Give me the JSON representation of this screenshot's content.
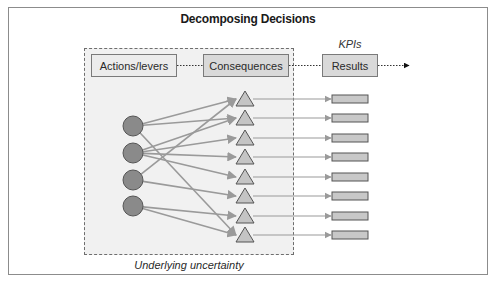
{
  "title": "Decomposing Decisions",
  "stages": {
    "actions": "Actions/levers",
    "consequences": "Consequences",
    "results": "Results"
  },
  "kpis_label": "KPIs",
  "uncertainty_label": "Underlying uncertainty",
  "colors": {
    "frame_border": "#8c8c8c",
    "uncertainty_fill": "#f1f1f1",
    "node_circle_fill": "#8a8a8a",
    "node_triangle_fill": "#c4c4c4",
    "result_bar_fill": "#c8c8c8",
    "edge_color": "#9a9a9a"
  },
  "nodes": {
    "actions": [
      {
        "id": "A1",
        "shape": "circle",
        "y": 126
      },
      {
        "id": "A2",
        "shape": "circle",
        "y": 153
      },
      {
        "id": "A3",
        "shape": "circle",
        "y": 180
      },
      {
        "id": "A4",
        "shape": "circle",
        "y": 206
      }
    ],
    "consequences": [
      {
        "id": "C1",
        "shape": "triangle",
        "y": 99
      },
      {
        "id": "C2",
        "shape": "triangle",
        "y": 118
      },
      {
        "id": "C3",
        "shape": "triangle",
        "y": 138
      },
      {
        "id": "C4",
        "shape": "triangle",
        "y": 157
      },
      {
        "id": "C5",
        "shape": "triangle",
        "y": 177
      },
      {
        "id": "C6",
        "shape": "triangle",
        "y": 196
      },
      {
        "id": "C7",
        "shape": "triangle",
        "y": 216
      },
      {
        "id": "C8",
        "shape": "triangle",
        "y": 235
      }
    ],
    "results": [
      {
        "id": "R1",
        "shape": "bar",
        "y": 99
      },
      {
        "id": "R2",
        "shape": "bar",
        "y": 118
      },
      {
        "id": "R3",
        "shape": "bar",
        "y": 138
      },
      {
        "id": "R4",
        "shape": "bar",
        "y": 157
      },
      {
        "id": "R5",
        "shape": "bar",
        "y": 177
      },
      {
        "id": "R6",
        "shape": "bar",
        "y": 196
      },
      {
        "id": "R7",
        "shape": "bar",
        "y": 216
      },
      {
        "id": "R8",
        "shape": "bar",
        "y": 235
      }
    ]
  },
  "edges": {
    "action_to_consequence": [
      [
        "A1",
        "C1"
      ],
      [
        "A1",
        "C2"
      ],
      [
        "A1",
        "C8"
      ],
      [
        "A2",
        "C2"
      ],
      [
        "A2",
        "C3"
      ],
      [
        "A2",
        "C4"
      ],
      [
        "A2",
        "C5"
      ],
      [
        "A3",
        "C1"
      ],
      [
        "A3",
        "C6"
      ],
      [
        "A4",
        "C7"
      ],
      [
        "A4",
        "C8"
      ]
    ],
    "consequence_to_result": [
      [
        "C1",
        "R1"
      ],
      [
        "C2",
        "R2"
      ],
      [
        "C3",
        "R3"
      ],
      [
        "C4",
        "R4"
      ],
      [
        "C5",
        "R5"
      ],
      [
        "C6",
        "R6"
      ],
      [
        "C7",
        "R7"
      ],
      [
        "C8",
        "R8"
      ]
    ]
  }
}
